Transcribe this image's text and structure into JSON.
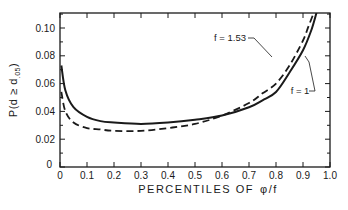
{
  "chart_data": {
    "type": "line",
    "title": "",
    "xlabel": "PERCENTILES OF φ/f",
    "ylabel": "P(d ≥ d.05)",
    "xlim": [
      0,
      1.0
    ],
    "ylim": [
      0,
      0.111
    ],
    "grid": false,
    "legend_position": "inline annotations",
    "x_ticks": [
      "0",
      "0.1",
      "0.2",
      "0.3",
      "0.4",
      "0.5",
      "0.6",
      "0.7",
      "0.8",
      "0.9",
      "1.0"
    ],
    "y_ticks": [
      "0",
      "0.02",
      "0.04",
      "0.06",
      "0.08",
      "0.10"
    ],
    "series": [
      {
        "name": "f = 1",
        "style": "solid",
        "x": [
          0.005,
          0.02,
          0.05,
          0.1,
          0.15,
          0.2,
          0.3,
          0.4,
          0.5,
          0.6,
          0.7,
          0.75,
          0.8,
          0.85,
          0.9,
          0.93,
          0.95
        ],
        "values": [
          0.073,
          0.055,
          0.043,
          0.036,
          0.033,
          0.032,
          0.031,
          0.032,
          0.034,
          0.037,
          0.043,
          0.048,
          0.054,
          0.068,
          0.084,
          0.098,
          0.111
        ]
      },
      {
        "name": "f = 1.53",
        "style": "dashed",
        "x": [
          0.005,
          0.02,
          0.05,
          0.1,
          0.15,
          0.2,
          0.3,
          0.4,
          0.5,
          0.6,
          0.7,
          0.75,
          0.8,
          0.85,
          0.9,
          0.92,
          0.94
        ],
        "values": [
          0.054,
          0.04,
          0.032,
          0.028,
          0.027,
          0.026,
          0.026,
          0.028,
          0.031,
          0.037,
          0.046,
          0.053,
          0.06,
          0.073,
          0.091,
          0.101,
          0.111
        ]
      }
    ],
    "annotations": [
      {
        "text": "f = 1.53",
        "target_series": "f = 1.53"
      },
      {
        "text": "f = 1",
        "target_series": "f = 1"
      }
    ]
  },
  "labels": {
    "xlabel_main": "PERCENTILES   OF",
    "xlabel_symbol": "φ/f",
    "ylabel": "P(d ≥ d",
    "ylabel_sub": ".05",
    "ylabel_close": ")",
    "annot_f153": "f = 1.53",
    "annot_f1": "f = 1"
  }
}
